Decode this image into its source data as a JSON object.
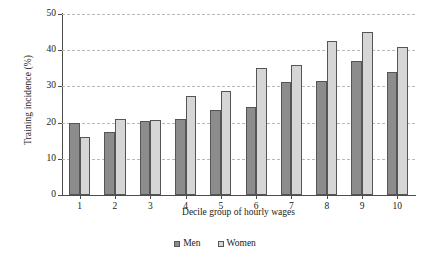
{
  "chart_data": {
    "type": "bar",
    "title": "",
    "xlabel": "Decile group of hourly wages",
    "ylabel": "Training incidence (%)",
    "categories": [
      "1",
      "2",
      "3",
      "4",
      "5",
      "6",
      "7",
      "8",
      "9",
      "10"
    ],
    "series": [
      {
        "name": "Men",
        "color": "#8c8c8c",
        "values": [
          20.0,
          17.5,
          20.5,
          21.0,
          23.5,
          24.3,
          31.2,
          31.5,
          37.0,
          34.0
        ]
      },
      {
        "name": "Women",
        "color": "#d6d6d6",
        "values": [
          16.0,
          21.0,
          20.8,
          27.3,
          28.8,
          35.0,
          35.8,
          42.5,
          45.0,
          41.0
        ]
      }
    ],
    "ylim": [
      0,
      50
    ],
    "ytick_labels": [
      "0",
      "10",
      "20",
      "30",
      "40",
      "50"
    ],
    "ytick_values": [
      0,
      10,
      20,
      30,
      40,
      50
    ],
    "grid": "horizontal-dashed",
    "legend_position": "bottom-center"
  },
  "legend": {
    "entries": [
      {
        "label": "Men"
      },
      {
        "label": "Women"
      }
    ]
  }
}
